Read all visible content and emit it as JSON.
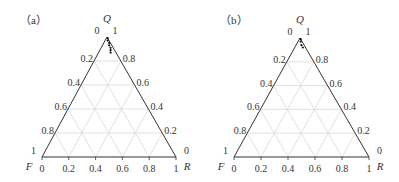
{
  "chart_data": [
    {
      "type": "ternary-scatter",
      "panel_label": "（a）",
      "axes": {
        "top": "Q",
        "left": "F",
        "right": "R"
      },
      "ticks": [
        "0",
        "0.2",
        "0.4",
        "0.6",
        "0.8",
        "1"
      ],
      "left_ticks": [
        "0",
        "0.2",
        "0.4",
        "0.6",
        "0.8",
        "1"
      ],
      "right_ticks": [
        "1",
        "0.8",
        "0.6",
        "0.4",
        "0.2",
        "0"
      ],
      "bottom_ticks": [
        "0",
        "0.2",
        "0.4",
        "0.6",
        "0.8",
        "1"
      ],
      "grid": true,
      "points": [
        {
          "Q": 0.99,
          "F": 0.0,
          "R": 0.01
        },
        {
          "Q": 0.97,
          "F": 0.01,
          "R": 0.02
        },
        {
          "Q": 0.95,
          "F": 0.01,
          "R": 0.04
        },
        {
          "Q": 0.93,
          "F": 0.02,
          "R": 0.05
        },
        {
          "Q": 0.91,
          "F": 0.02,
          "R": 0.07
        },
        {
          "Q": 0.89,
          "F": 0.03,
          "R": 0.08
        },
        {
          "Q": 0.87,
          "F": 0.04,
          "R": 0.09
        }
      ]
    },
    {
      "type": "ternary-scatter",
      "panel_label": "（b）",
      "axes": {
        "top": "Q",
        "left": "F",
        "right": "R"
      },
      "ticks": [
        "0",
        "0.2",
        "0.4",
        "0.6",
        "0.8",
        "1"
      ],
      "left_ticks": [
        "0",
        "0.2",
        "0.4",
        "0.6",
        "0.8",
        "1"
      ],
      "right_ticks": [
        "1",
        "0.8",
        "0.6",
        "0.4",
        "0.2",
        "0"
      ],
      "bottom_ticks": [
        "0",
        "0.2",
        "0.4",
        "0.6",
        "0.8",
        "1"
      ],
      "grid": true,
      "points": [
        {
          "Q": 0.99,
          "F": 0.0,
          "R": 0.01
        },
        {
          "Q": 0.97,
          "F": 0.01,
          "R": 0.02
        },
        {
          "Q": 0.94,
          "F": 0.02,
          "R": 0.04
        },
        {
          "Q": 0.92,
          "F": 0.02,
          "R": 0.06
        }
      ]
    }
  ],
  "panels": {
    "a": {
      "label": "（a）"
    },
    "b": {
      "label": "（b）"
    }
  }
}
